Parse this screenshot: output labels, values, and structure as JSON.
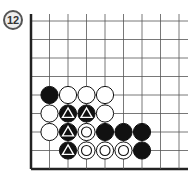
{
  "diagram": {
    "number_badge": "12",
    "board": {
      "origin_x": 31,
      "origin_y": 21,
      "spacing": 18.5,
      "cols": 9,
      "rows": 8,
      "edges": [
        "left",
        "bottom"
      ],
      "line_color": "#555555",
      "edge_color": "#222222"
    },
    "stones": [
      {
        "col": 1,
        "row": 4,
        "color": "black",
        "mark": ""
      },
      {
        "col": 2,
        "row": 4,
        "color": "white",
        "mark": ""
      },
      {
        "col": 3,
        "row": 4,
        "color": "white",
        "mark": ""
      },
      {
        "col": 4,
        "row": 4,
        "color": "white",
        "mark": ""
      },
      {
        "col": 1,
        "row": 5,
        "color": "white",
        "mark": ""
      },
      {
        "col": 2,
        "row": 5,
        "color": "black",
        "mark": "triangle"
      },
      {
        "col": 3,
        "row": 5,
        "color": "black",
        "mark": "triangle"
      },
      {
        "col": 4,
        "row": 5,
        "color": "white",
        "mark": ""
      },
      {
        "col": 1,
        "row": 6,
        "color": "white",
        "mark": ""
      },
      {
        "col": 2,
        "row": 6,
        "color": "black",
        "mark": "triangle"
      },
      {
        "col": 3,
        "row": 6,
        "color": "white",
        "mark": "circle"
      },
      {
        "col": 4,
        "row": 6,
        "color": "black",
        "mark": ""
      },
      {
        "col": 5,
        "row": 6,
        "color": "black",
        "mark": ""
      },
      {
        "col": 6,
        "row": 6,
        "color": "black",
        "mark": ""
      },
      {
        "col": 2,
        "row": 7,
        "color": "black",
        "mark": "triangle"
      },
      {
        "col": 3,
        "row": 7,
        "color": "white",
        "mark": "circle"
      },
      {
        "col": 4,
        "row": 7,
        "color": "white",
        "mark": "circle"
      },
      {
        "col": 5,
        "row": 7,
        "color": "white",
        "mark": "circle"
      },
      {
        "col": 6,
        "row": 7,
        "color": "black",
        "mark": ""
      }
    ]
  }
}
